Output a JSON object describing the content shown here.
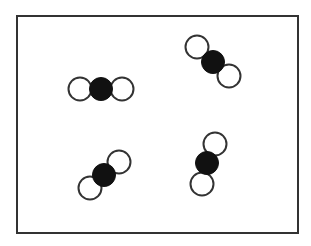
{
  "diagram": {
    "type": "molecular-model",
    "frame": {
      "x": 17,
      "y": 16,
      "width": 281,
      "height": 217,
      "stroke": "#333333",
      "stroke_width": 2
    },
    "colors": {
      "central_atom": "#111111",
      "outer_atom_fill": "#ffffff",
      "outer_atom_stroke": "#333333",
      "background": "#ffffff"
    },
    "atom_radius": 11.5,
    "molecules": [
      {
        "id": "molecule-1",
        "atoms": [
          {
            "role": "outer",
            "cx": 80,
            "cy": 89
          },
          {
            "role": "outer",
            "cx": 122,
            "cy": 89
          },
          {
            "role": "central",
            "cx": 101,
            "cy": 89
          }
        ]
      },
      {
        "id": "molecule-2",
        "atoms": [
          {
            "role": "outer",
            "cx": 197,
            "cy": 47
          },
          {
            "role": "outer",
            "cx": 229,
            "cy": 76
          },
          {
            "role": "central",
            "cx": 213,
            "cy": 62
          }
        ]
      },
      {
        "id": "molecule-3",
        "atoms": [
          {
            "role": "outer",
            "cx": 119,
            "cy": 162
          },
          {
            "role": "outer",
            "cx": 90,
            "cy": 188
          },
          {
            "role": "central",
            "cx": 104,
            "cy": 175
          }
        ]
      },
      {
        "id": "molecule-4",
        "atoms": [
          {
            "role": "outer",
            "cx": 215,
            "cy": 144
          },
          {
            "role": "outer",
            "cx": 202,
            "cy": 184
          },
          {
            "role": "central",
            "cx": 207,
            "cy": 163
          }
        ]
      }
    ]
  }
}
